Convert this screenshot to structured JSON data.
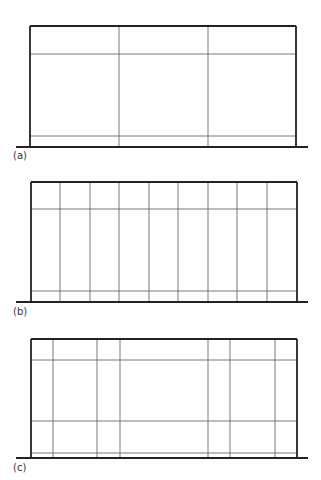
{
  "figure": {
    "panels": [
      {
        "label": "(a)",
        "frame": {
          "x": 30,
          "y": 26,
          "w": 266,
          "h": 121
        },
        "ground": {
          "y": 147,
          "x1": 16,
          "x2": 308
        },
        "verticals": [
          119,
          208
        ],
        "horizontals": [
          54,
          136
        ]
      },
      {
        "label": "(b)",
        "frame": {
          "x": 31,
          "y": 182,
          "w": 266,
          "h": 120
        },
        "ground": {
          "y": 302,
          "x1": 16,
          "x2": 308
        },
        "verticals": [
          60,
          90,
          119,
          149,
          178,
          208,
          237,
          267
        ],
        "horizontals": [
          209,
          291
        ]
      },
      {
        "label": "(c)",
        "frame": {
          "x": 31,
          "y": 339,
          "w": 266,
          "h": 119
        },
        "ground": {
          "y": 458,
          "x1": 16,
          "x2": 308
        },
        "verticals": [
          53,
          97,
          120,
          208,
          230,
          275
        ],
        "horizontals": [
          360,
          421,
          453
        ]
      }
    ],
    "colors": {
      "frame": "#222222",
      "grid": "#555555"
    }
  }
}
